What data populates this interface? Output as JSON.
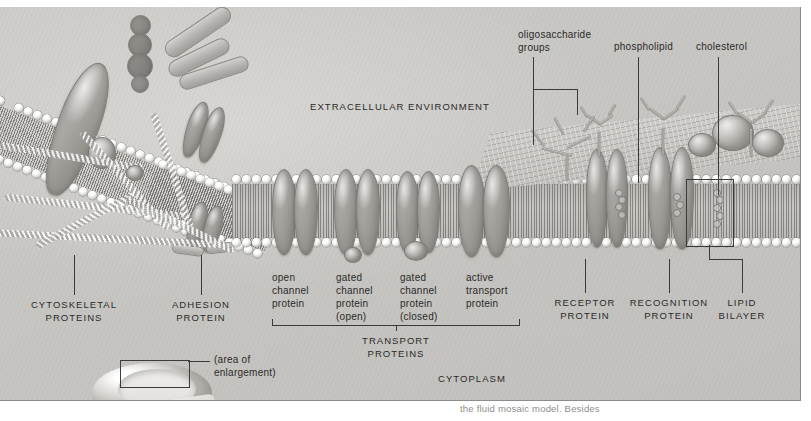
{
  "figure": {
    "compartments": {
      "extracellular": "EXTRACELLULAR ENVIRONMENT",
      "cytoplasm": "CYTOPLASM"
    },
    "top_labels": [
      {
        "id": "oligosaccharide-groups",
        "line1": "oligosaccharide",
        "line2": "groups"
      },
      {
        "id": "phospholipid",
        "line1": "phospholipid",
        "line2": ""
      },
      {
        "id": "cholesterol",
        "line1": "cholesterol",
        "line2": ""
      }
    ],
    "left_labels": [
      {
        "id": "cytoskeletal-proteins",
        "line1": "CYTOSKELETAL",
        "line2": "PROTEINS"
      },
      {
        "id": "adhesion-protein",
        "line1": "ADHESION",
        "line2": "PROTEIN"
      }
    ],
    "transport_labels": [
      {
        "id": "open-channel-protein",
        "lines": [
          "open",
          "channel",
          "protein"
        ]
      },
      {
        "id": "gated-channel-protein-open",
        "lines": [
          "gated",
          "channel",
          "protein",
          "(open)"
        ]
      },
      {
        "id": "gated-channel-protein-closed",
        "lines": [
          "gated",
          "channel",
          "protein",
          "(closed)"
        ]
      },
      {
        "id": "active-transport-protein",
        "lines": [
          "active",
          "transport",
          "protein"
        ]
      }
    ],
    "transport_group": {
      "line1": "TRANSPORT",
      "line2": "PROTEINS"
    },
    "right_labels": [
      {
        "id": "receptor-protein",
        "line1": "RECEPTOR",
        "line2": "PROTEIN"
      },
      {
        "id": "recognition-protein",
        "line1": "RECOGNITION",
        "line2": "PROTEIN"
      },
      {
        "id": "lipid-bilayer",
        "line1": "LIPID",
        "line2": "BILAYER"
      }
    ],
    "inset": {
      "line1": "(area of",
      "line2": "enlargement)"
    },
    "caption_fragment": "the fluid mosaic model. Besides"
  }
}
